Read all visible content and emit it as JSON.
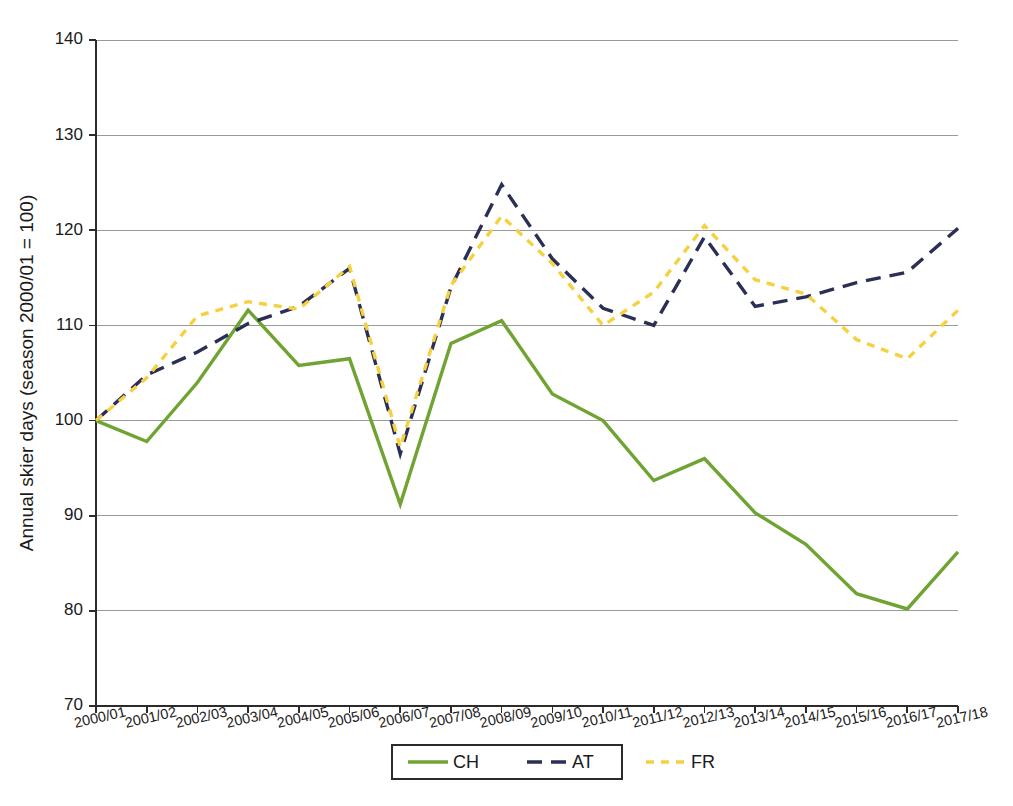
{
  "chart_data": {
    "type": "line",
    "title": "",
    "xlabel": "",
    "ylabel": "Annual skier days (season 2000/01 = 100)",
    "ylim": [
      70,
      140
    ],
    "yticks": [
      70,
      80,
      90,
      100,
      110,
      120,
      130,
      140
    ],
    "grid": true,
    "legend_position": "bottom",
    "categories": [
      "2000/01",
      "2001/02",
      "2002/03",
      "2003/04",
      "2004/05",
      "2005/06",
      "2006/07",
      "2007/08",
      "2008/09",
      "2009/10",
      "2010/11",
      "2011/12",
      "2012/13",
      "2013/14",
      "2014/15",
      "2015/16",
      "2016/17",
      "2017/18"
    ],
    "series": [
      {
        "name": "CH",
        "color": "#6fa332",
        "style": "solid",
        "values": [
          100.0,
          97.8,
          104.0,
          111.6,
          105.8,
          106.5,
          91.2,
          108.1,
          110.5,
          102.8,
          100.0,
          93.7,
          96.0,
          90.3,
          87.0,
          81.8,
          80.2,
          86.2
        ]
      },
      {
        "name": "AT",
        "color": "#2b2f55",
        "style": "dashed",
        "values": [
          100.0,
          104.8,
          107.2,
          110.2,
          112.0,
          116.0,
          96.5,
          114.0,
          124.8,
          117.0,
          111.8,
          110.0,
          119.3,
          112.0,
          113.0,
          114.5,
          115.6,
          120.2
        ]
      },
      {
        "name": "FR",
        "color": "#f5d142",
        "style": "dotted",
        "values": [
          100.0,
          104.5,
          111.0,
          112.5,
          111.7,
          116.2,
          97.2,
          114.2,
          121.5,
          116.5,
          110.0,
          113.5,
          120.5,
          114.8,
          113.3,
          108.5,
          106.5,
          111.6
        ]
      }
    ]
  },
  "legend": {
    "items": [
      {
        "label": "CH",
        "color": "#6fa332",
        "style": "solid"
      },
      {
        "label": "AT",
        "color": "#2b2f55",
        "style": "dashed"
      },
      {
        "label": "FR",
        "color": "#f5d142",
        "style": "dotted"
      }
    ]
  },
  "axes": {
    "y_title": "Annual skier days (season 2000/01 = 100)"
  }
}
